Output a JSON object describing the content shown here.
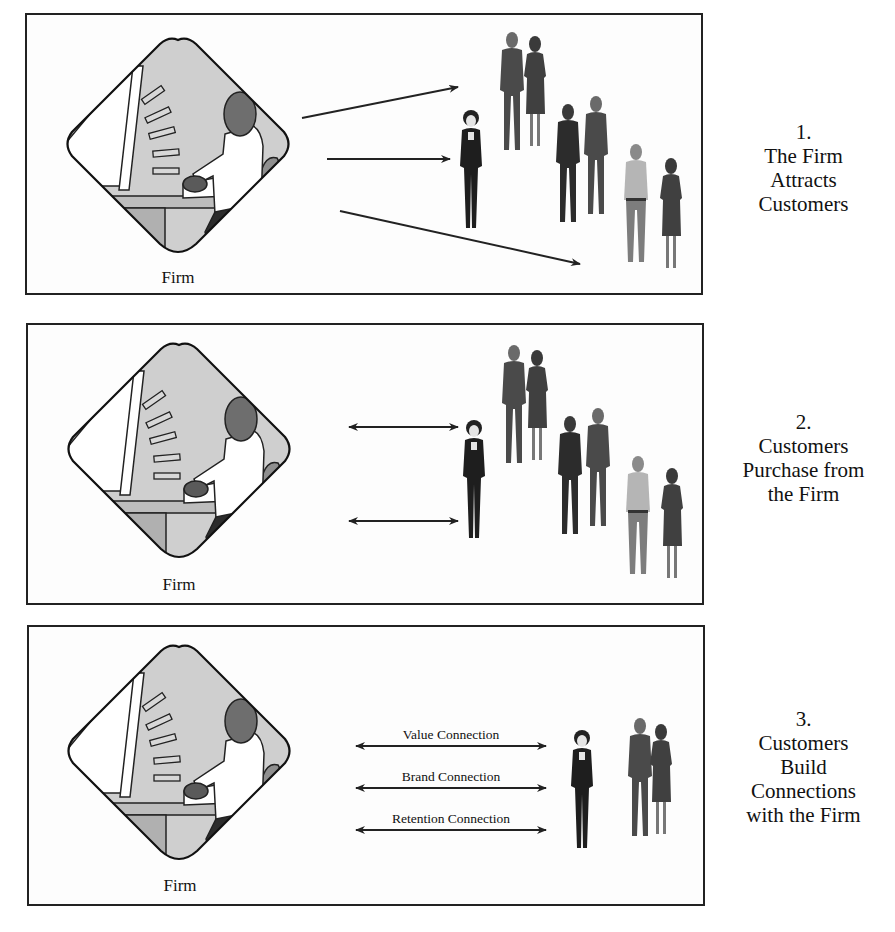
{
  "panels": [
    {
      "number": "1.",
      "caption_lines": [
        "The Firm",
        "Attracts",
        "Customers"
      ],
      "firm_label": "Firm",
      "arrow_style": "one-way",
      "arrow_count": 3
    },
    {
      "number": "2.",
      "caption_lines": [
        "Customers",
        "Purchase from",
        "the Firm"
      ],
      "firm_label": "Firm",
      "arrow_style": "two-way",
      "arrow_count": 2
    },
    {
      "number": "3.",
      "caption_lines": [
        "Customers",
        "Build",
        "Connections",
        "with the Firm"
      ],
      "firm_label": "Firm",
      "arrow_style": "two-way",
      "arrow_count": 3,
      "connections": [
        "Value Connection",
        "Brand Connection",
        "Retention Connection"
      ]
    }
  ],
  "colors": {
    "border": "#222222",
    "diamond_fill": "#c8c8c8",
    "figure_dark": "#2a2a2a",
    "figure_mid": "#555555",
    "figure_light": "#8a8a8a"
  }
}
